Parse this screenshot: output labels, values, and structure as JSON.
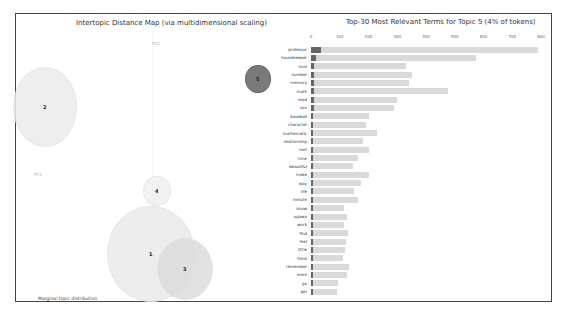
{
  "left_panel": {
    "title": "Intertopic Distance Map (via multidimensional scaling)",
    "pc1_label": "PC1",
    "pc2_label": "PC2",
    "marginal_label": "Marginal topic distribution",
    "topics": [
      {
        "id": "1",
        "cx": 150,
        "cy": 253,
        "r": 44,
        "color": "#eaeaea"
      },
      {
        "id": "2",
        "cx": 44,
        "cy": 106,
        "r": 32,
        "color": "#ececec"
      },
      {
        "id": "3",
        "cx": 184,
        "cy": 268,
        "r": 28,
        "color": "#dcdcdc"
      },
      {
        "id": "4",
        "cx": 156,
        "cy": 190,
        "r": 14,
        "color": "#f0f0f0"
      },
      {
        "id": "5",
        "cx": 257,
        "cy": 78,
        "r": 13,
        "color": "#7a7a7a"
      }
    ]
  },
  "chart_data": {
    "type": "bar",
    "title": "Top-30 Most Relevant Terms for Topic 5 (4% of tokens)",
    "xlabel": "",
    "ylabel": "",
    "xlim": [
      0,
      800
    ],
    "x_ticks": [
      "0",
      "100",
      "200",
      "300",
      "400",
      "500",
      "600",
      "700",
      "800"
    ],
    "categories": [
      "professor",
      "housekeeper",
      "love",
      "number",
      "memory",
      "math",
      "read",
      "son",
      "baseball",
      "character",
      "mathematic",
      "relationship",
      "root",
      "time",
      "beautiful",
      "make",
      "way",
      "life",
      "minute",
      "know",
      "ogawa",
      "work",
      "find",
      "feel",
      "little",
      "think",
      "remember",
      "even",
      "go",
      "get"
    ],
    "series": [
      {
        "name": "Overall term frequency",
        "color": "#d9d9d9",
        "values": [
          790,
          575,
          330,
          350,
          340,
          475,
          300,
          290,
          200,
          190,
          230,
          180,
          200,
          165,
          145,
          200,
          175,
          150,
          165,
          115,
          125,
          115,
          130,
          120,
          118,
          110,
          132,
          125,
          95,
          90
        ]
      },
      {
        "name": "Estimated term frequency within the selected topic",
        "color": "#666666",
        "values": [
          35,
          18,
          12,
          12,
          12,
          12,
          10,
          10,
          8,
          8,
          8,
          8,
          8,
          6,
          6,
          6,
          6,
          6,
          6,
          5,
          5,
          5,
          5,
          5,
          5,
          5,
          5,
          5,
          5,
          5
        ]
      }
    ],
    "grid": false,
    "legend_position": "none"
  }
}
